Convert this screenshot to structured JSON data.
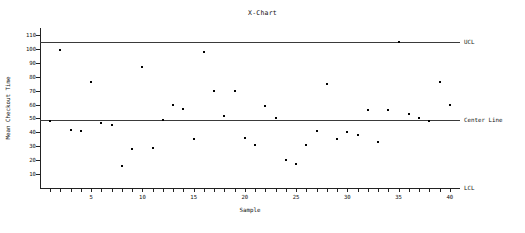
{
  "chart_data": {
    "type": "scatter",
    "title": "X-Chart",
    "xlabel": "Sample",
    "ylabel": "Mean Checkout Time",
    "xlim": [
      0,
      41
    ],
    "ylim": [
      0,
      115
    ],
    "grid": false,
    "legend": "none",
    "x_ticks": [
      5,
      10,
      15,
      20,
      25,
      30,
      35,
      40
    ],
    "x_minor_ticks": [
      1,
      2,
      3,
      4,
      5,
      6,
      7,
      8,
      9,
      10,
      11,
      12,
      13,
      14,
      15,
      16,
      17,
      18,
      19,
      20,
      21,
      22,
      23,
      24,
      25,
      26,
      27,
      28,
      29,
      30,
      31,
      32,
      33,
      34,
      35,
      36,
      37,
      38,
      39,
      40
    ],
    "y_ticks": [
      10,
      20,
      30,
      40,
      50,
      60,
      70,
      80,
      90,
      100,
      110
    ],
    "control_lines": [
      {
        "name": "UCL",
        "label": "UCL",
        "value": 105
      },
      {
        "name": "center-line",
        "label": "Center Line",
        "value": 49
      },
      {
        "name": "LCL",
        "label": "LCL",
        "value": 0
      }
    ],
    "x": [
      1,
      2,
      3,
      4,
      5,
      6,
      7,
      8,
      9,
      10,
      11,
      12,
      13,
      14,
      15,
      16,
      17,
      18,
      19,
      20,
      21,
      22,
      23,
      24,
      25,
      26,
      27,
      28,
      29,
      30,
      31,
      32,
      33,
      34,
      35,
      36,
      37,
      38,
      39,
      40
    ],
    "values": [
      48,
      99,
      42,
      41,
      76,
      47,
      45,
      16,
      28,
      87,
      29,
      49,
      60,
      57,
      35,
      98,
      70,
      52,
      70,
      36,
      31,
      59,
      50,
      20,
      17,
      31,
      41,
      75,
      35,
      40,
      38,
      56,
      33,
      56,
      105,
      53,
      50,
      48,
      76,
      60
    ],
    "series": [
      {
        "name": "Mean Checkout Time",
        "values": [
          48,
          99,
          42,
          41,
          76,
          47,
          45,
          16,
          28,
          87,
          29,
          49,
          60,
          57,
          35,
          98,
          70,
          52,
          70,
          36,
          31,
          59,
          50,
          20,
          17,
          31,
          41,
          75,
          35,
          40,
          38,
          56,
          33,
          56,
          105,
          53,
          50,
          48,
          76,
          60
        ]
      }
    ]
  }
}
